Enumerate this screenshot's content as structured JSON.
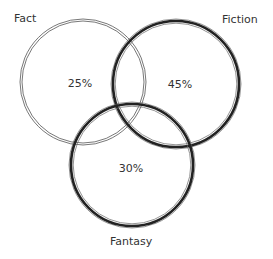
{
  "diagram": {
    "type": "venn",
    "sets": [
      {
        "name": "Fact",
        "value": "25%",
        "cx": 83,
        "cy": 82,
        "r": 62,
        "stroke": "light"
      },
      {
        "name": "Fiction",
        "value": "45%",
        "cx": 176,
        "cy": 84,
        "r": 63,
        "stroke": "heavy"
      },
      {
        "name": "Fantasy",
        "value": "30%",
        "cx": 132,
        "cy": 165,
        "r": 61,
        "stroke": "heavy"
      }
    ],
    "colors": {
      "line": "#222222",
      "light_line": "#555555",
      "text": "#333333"
    }
  },
  "labels": {
    "fact": "Fact",
    "fiction": "Fiction",
    "fantasy": "Fantasy",
    "fact_pct": "25%",
    "fiction_pct": "45%",
    "fantasy_pct": "30%"
  }
}
